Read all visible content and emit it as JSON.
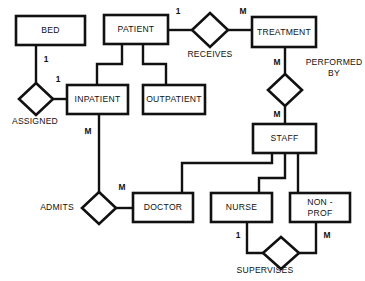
{
  "diagram": {
    "type": "entity-relationship-diagram",
    "colors": {
      "background": "#ffffff",
      "stroke": "#111111",
      "fill": "#ffffff"
    },
    "entities": [
      {
        "id": "bed",
        "label": "BED",
        "x": 16,
        "y": 16,
        "w": 69,
        "h": 29
      },
      {
        "id": "patient",
        "label": "PATIENT",
        "x": 104,
        "y": 15,
        "w": 64,
        "h": 29
      },
      {
        "id": "treatment",
        "label": "TREATMENT",
        "x": 252,
        "y": 17,
        "w": 64,
        "h": 30
      },
      {
        "id": "inpatient",
        "label": "INPATIENT",
        "x": 67,
        "y": 85,
        "w": 61,
        "h": 29
      },
      {
        "id": "outpatient",
        "label": "OUTPATIENT",
        "x": 143,
        "y": 85,
        "w": 62,
        "h": 29
      },
      {
        "id": "staff",
        "label": "STAFF",
        "x": 253,
        "y": 124,
        "w": 63,
        "h": 29
      },
      {
        "id": "doctor",
        "label": "DOCTOR",
        "x": 133,
        "y": 193,
        "w": 60,
        "h": 29
      },
      {
        "id": "nurse",
        "label": "NURSE",
        "x": 211,
        "y": 193,
        "w": 61,
        "h": 29
      },
      {
        "id": "nonprof",
        "label": "NON -",
        "label2": "PROF",
        "x": 290,
        "y": 193,
        "w": 60,
        "h": 29
      }
    ],
    "relationships": [
      {
        "id": "assigned",
        "label": "ASSIGNED",
        "cx": 36,
        "cy": 99,
        "rx": 17,
        "ry": 16,
        "label_x": 35,
        "label_y": 122
      },
      {
        "id": "receives",
        "label": "RECEIVES",
        "cx": 210,
        "cy": 30,
        "rx": 18,
        "ry": 17,
        "label_x": 210,
        "label_y": 55
      },
      {
        "id": "performed_by",
        "label": "PERFORMED",
        "label2": "BY",
        "cx": 285,
        "cy": 90,
        "rx": 17,
        "ry": 16,
        "label_x": 334,
        "label_y": 63
      },
      {
        "id": "admits",
        "label": "ADMITS",
        "cx": 99,
        "cy": 208,
        "rx": 17,
        "ry": 16,
        "label_x": 57,
        "label_y": 208
      },
      {
        "id": "supervises",
        "label": "SUPERVISES",
        "cx": 281,
        "cy": 253,
        "rx": 18,
        "ry": 16,
        "label_x": 265,
        "label_y": 271
      }
    ],
    "cardinalities": [
      {
        "id": "bed-assigned",
        "text": "1",
        "x": 46,
        "y": 60
      },
      {
        "id": "assigned-inpatient",
        "text": "1",
        "x": 58,
        "y": 80
      },
      {
        "id": "patient-receives",
        "text": "1",
        "x": 178,
        "y": 12
      },
      {
        "id": "receives-treatment",
        "text": "M",
        "x": 243,
        "y": 12
      },
      {
        "id": "treatment-performedby",
        "text": "M",
        "x": 277,
        "y": 63
      },
      {
        "id": "performedby-staff",
        "text": "M",
        "x": 277,
        "y": 115
      },
      {
        "id": "inpatient-admits",
        "text": "M",
        "x": 88,
        "y": 132
      },
      {
        "id": "admits-doctor",
        "text": "M",
        "x": 122,
        "y": 188
      },
      {
        "id": "nurse-supervises",
        "text": "1",
        "x": 238,
        "y": 236
      },
      {
        "id": "nonprof-supervises",
        "text": "M",
        "x": 327,
        "y": 236
      }
    ],
    "connectors": [
      {
        "id": "bed-to-assigned",
        "d": "M 36 45 L 36 83"
      },
      {
        "id": "assigned-to-inpatient",
        "d": "M 53 99 L 67 99"
      },
      {
        "id": "patient-to-receives",
        "d": "M 168 30 L 192 30"
      },
      {
        "id": "receives-to-treatment",
        "d": "M 228 30 L 252 30"
      },
      {
        "id": "treatment-to-performedby",
        "d": "M 285 47 L 285 74"
      },
      {
        "id": "performedby-to-staff",
        "d": "M 285 106 L 285 124"
      },
      {
        "id": "patient-to-inpatient",
        "d": "M 122 44 L 122 64 L 97 64 L 97 85"
      },
      {
        "id": "patient-to-outpatient",
        "d": "M 143 44 L 143 64 L 166 64 L 166 85"
      },
      {
        "id": "inpatient-to-admits",
        "d": "M 99 114 L 99 192"
      },
      {
        "id": "admits-to-doctor",
        "d": "M 116 208 L 133 208"
      },
      {
        "id": "staff-to-doctor",
        "d": "M 272 153 L 272 163 L 182 163 L 182 193"
      },
      {
        "id": "staff-to-nurse",
        "d": "M 285 153 L 285 178 L 259 178 L 259 193"
      },
      {
        "id": "staff-to-nonprof",
        "d": "M 298 153 L 298 193"
      },
      {
        "id": "nurse-to-supervises",
        "d": "M 247 222 L 247 253 L 263 253"
      },
      {
        "id": "nonprof-to-supervises",
        "d": "M 316 222 L 316 253 L 299 253"
      }
    ]
  }
}
